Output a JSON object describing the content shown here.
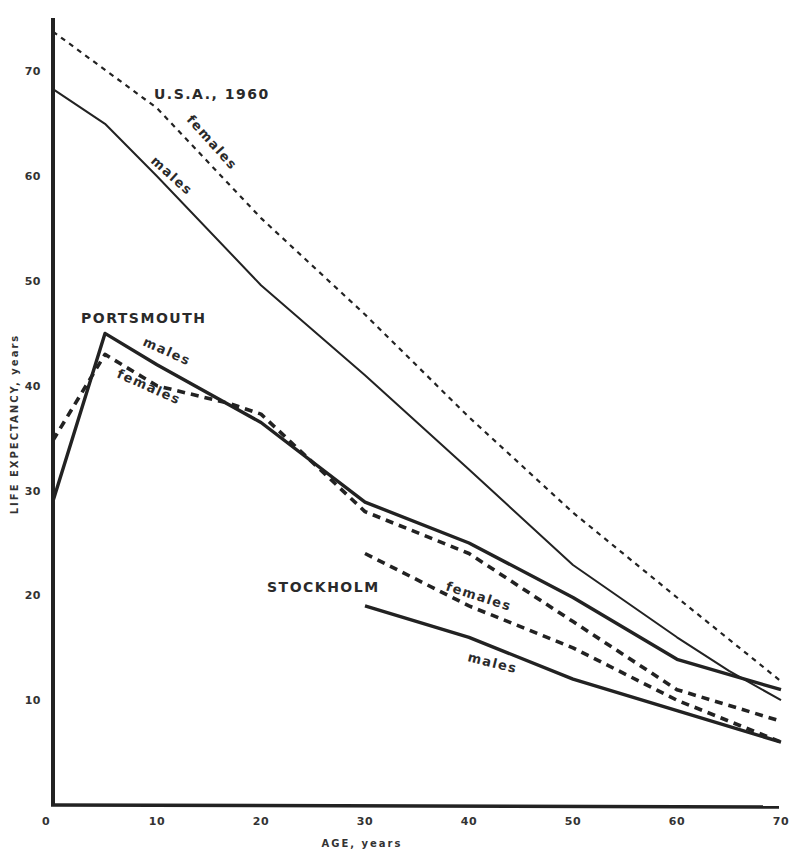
{
  "chart_data": {
    "type": "line",
    "title": "",
    "xlabel": "AGE, years",
    "ylabel": "LIFE EXPECTANCY, years",
    "xlim": [
      0,
      70
    ],
    "ylim": [
      0,
      75
    ],
    "xticks": [
      0,
      10,
      20,
      30,
      40,
      50,
      60,
      70
    ],
    "yticks": [
      10,
      20,
      30,
      40,
      50,
      60,
      70
    ],
    "grid": false,
    "legend": "inline labels",
    "group_labels": {
      "usa": "U.S.A., 1960",
      "portsmouth": "PORTSMOUTH",
      "stockholm": "STOCKHOLM"
    },
    "line_labels": {
      "usa_females": "females",
      "usa_males": "males",
      "portsmouth_males": "males",
      "portsmouth_females": "females",
      "stockholm_females": "females",
      "stockholm_males": "males"
    },
    "series": [
      {
        "name": "U.S.A., 1960 females",
        "style": "dashed-thin",
        "x": [
          0,
          10,
          20,
          30,
          40,
          50,
          60,
          70
        ],
        "values": [
          73.8,
          66.5,
          56.0,
          46.8,
          37.0,
          27.9,
          19.8,
          11.8
        ]
      },
      {
        "name": "U.S.A., 1960 males",
        "style": "solid-thin",
        "x": [
          0,
          5,
          10,
          20,
          30,
          40,
          50,
          60,
          65,
          70
        ],
        "values": [
          68.3,
          65.0,
          60.0,
          49.6,
          41.0,
          32.0,
          22.9,
          16.0,
          12.8,
          10.0
        ]
      },
      {
        "name": "Portsmouth males",
        "style": "solid-thick",
        "x": [
          0,
          5,
          10,
          20,
          30,
          40,
          50,
          60,
          70
        ],
        "values": [
          29.0,
          45.0,
          42.0,
          36.5,
          28.9,
          25.0,
          19.8,
          13.9,
          11.0
        ]
      },
      {
        "name": "Portsmouth females",
        "style": "dashed-thick",
        "x": [
          0,
          5,
          10,
          17,
          20,
          30,
          40,
          50,
          60,
          70
        ],
        "values": [
          34.8,
          43.0,
          40.0,
          38.3,
          37.3,
          28.0,
          24.0,
          17.5,
          11.0,
          8.0
        ]
      },
      {
        "name": "Stockholm females",
        "style": "dashed-thick",
        "x": [
          30,
          40,
          50,
          60,
          70
        ],
        "values": [
          24.0,
          19.0,
          15.0,
          10.0,
          6.0
        ]
      },
      {
        "name": "Stockholm males",
        "style": "solid-thick",
        "x": [
          30,
          40,
          50,
          60,
          70
        ],
        "values": [
          19.0,
          16.0,
          12.0,
          9.0,
          6.0
        ]
      }
    ]
  }
}
